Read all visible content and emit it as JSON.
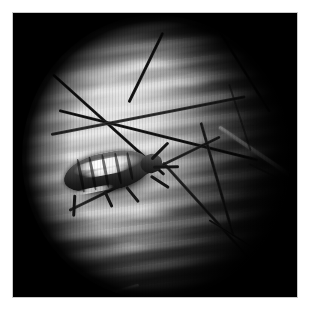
{
  "figure": {
    "kind": "dermoscopy-photomicrograph",
    "alt_text": "Grayscale dermoscopic close-up of a parasitic insect on hairy human skin",
    "canvas_width_px": 311,
    "canvas_height_px": 315,
    "mount_color": "#ffffff",
    "plate_color": "#000000",
    "plate_border_color": "#c9c9c9",
    "plate_rect_px": {
      "x": 13,
      "y": 13,
      "width": 284,
      "height": 284
    }
  },
  "field_of_view": {
    "shape": "circle",
    "center_px": {
      "x": 143,
      "y": 144
    },
    "radius_px": 134,
    "vignette": "strong",
    "illumination": "bright upper-left, falling off to lower-right",
    "bright_tone_hex": "#d2d2d2",
    "mid_tone_hex": "#8a8a8a",
    "dark_tone_hex": "#1a1a1a"
  },
  "scene": {
    "subject": "insect on skin",
    "background_texture": "horizontal skin furrow striations with scaly highlights",
    "color_mode": "grayscale"
  },
  "insect": {
    "label": "insect-body",
    "position_px": {
      "x": 36,
      "y": 128
    },
    "size_px": {
      "width": 116,
      "height": 66
    },
    "rotation_deg": -11,
    "body_hex": "#2b2b2b",
    "highlight_hex": "#f4f4f4",
    "segments": 5,
    "legs": 6
  },
  "hairs": [
    {
      "name": "hair-dark-1",
      "x": 150,
      "y": 18,
      "length": 78,
      "thickness": 3.0,
      "angle": 116,
      "tone": "dark"
    },
    {
      "name": "hair-dark-2",
      "x": 206,
      "y": 16,
      "length": 96,
      "thickness": 3.2,
      "angle": 58,
      "tone": "dark"
    },
    {
      "name": "hair-dark-3",
      "x": 40,
      "y": 60,
      "length": 150,
      "thickness": 3.0,
      "angle": 42,
      "tone": "dark"
    },
    {
      "name": "hair-dark-4",
      "x": 46,
      "y": 96,
      "length": 205,
      "thickness": 3.4,
      "angle": 14,
      "tone": "dark"
    },
    {
      "name": "hair-dark-5",
      "x": 38,
      "y": 120,
      "length": 198,
      "thickness": 3.0,
      "angle": -11,
      "tone": "dark"
    },
    {
      "name": "hair-dark-6",
      "x": 188,
      "y": 108,
      "length": 118,
      "thickness": 2.8,
      "angle": 74,
      "tone": "dark"
    },
    {
      "name": "hair-dark-7",
      "x": 150,
      "y": 148,
      "length": 128,
      "thickness": 3.0,
      "angle": 48,
      "tone": "dark"
    },
    {
      "name": "hair-dark-8",
      "x": 56,
      "y": 196,
      "length": 168,
      "thickness": 2.6,
      "angle": -26,
      "tone": "dark"
    },
    {
      "name": "hair-dark-9",
      "x": 196,
      "y": 206,
      "length": 56,
      "thickness": 2.4,
      "angle": 32,
      "tone": "dark"
    },
    {
      "name": "hair-white-1",
      "x": 206,
      "y": 112,
      "length": 86,
      "thickness": 4.2,
      "angle": 34,
      "tone": "white"
    },
    {
      "name": "hair-white-2",
      "x": 72,
      "y": 286,
      "length": 56,
      "thickness": 3.0,
      "angle": -16,
      "tone": "white"
    },
    {
      "name": "hair-faint-1",
      "x": 236,
      "y": 150,
      "length": 62,
      "thickness": 2.4,
      "angle": 26,
      "tone": "faint"
    },
    {
      "name": "hair-faint-2",
      "x": 216,
      "y": 70,
      "length": 70,
      "thickness": 2.2,
      "angle": 72,
      "tone": "faint"
    }
  ]
}
